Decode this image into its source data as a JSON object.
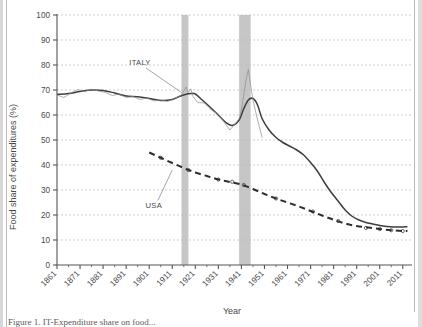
{
  "figure": {
    "caption_partial": "Figure 1. IT-Expenditure share on food...",
    "background_color": "#ffffff"
  },
  "chart_data": {
    "type": "line",
    "title": "",
    "xlabel": "Year",
    "ylabel": "Food share of expenditures (%)",
    "xlim": [
      1861,
      2015
    ],
    "ylim": [
      0,
      100
    ],
    "yticks": [
      0,
      10,
      20,
      30,
      40,
      50,
      60,
      70,
      80,
      90,
      100
    ],
    "xticks": [
      1861,
      1871,
      1881,
      1891,
      1901,
      1911,
      1921,
      1931,
      1941,
      1951,
      1961,
      1971,
      1981,
      1991,
      2001,
      2011
    ],
    "xtick_labels": [
      "1861",
      "1871",
      "1881",
      "1891",
      "1901",
      "1911",
      "1921",
      "1931",
      "1941",
      "1951",
      "1961",
      "1971",
      "1981",
      "1991",
      "2001",
      "2011"
    ],
    "grid": "horizontal-dashed",
    "legend_position": "inline-annotations",
    "colors": {
      "italy_smooth": "#3d3d3d",
      "italy_raw": "#8e8e8e",
      "usa_dashed": "#2e2e2e",
      "war_band": "#c6c6c6",
      "grid": "#b9b9b9",
      "axis": "#555555"
    },
    "annotations": [
      {
        "name": "ITALY",
        "label": "ITALY",
        "x": 1897,
        "y": 80,
        "leader_to_x": 1915,
        "leader_to_y": 69
      },
      {
        "name": "USA",
        "label": "USA",
        "x": 1903,
        "y": 23,
        "leader_to_x": 1911,
        "leader_to_y": 38
      }
    ],
    "shaded_bands": [
      {
        "name": "world-war-one",
        "x0": 1915,
        "x1": 1918,
        "label": "WWI"
      },
      {
        "name": "world-war-two",
        "x0": 1940,
        "x1": 1945,
        "label": "WWII"
      }
    ],
    "series": [
      {
        "name": "ITALY",
        "style": "solid",
        "x": [
          1861,
          1866,
          1871,
          1876,
          1881,
          1886,
          1891,
          1896,
          1901,
          1906,
          1911,
          1914,
          1917,
          1919,
          1921,
          1924,
          1927,
          1931,
          1934,
          1937,
          1940,
          1942,
          1944,
          1946,
          1948,
          1950,
          1953,
          1956,
          1959,
          1962,
          1965,
          1968,
          1971,
          1974,
          1977,
          1980,
          1983,
          1986,
          1989,
          1992,
          1995,
          1998,
          2001,
          2004,
          2007,
          2010,
          2013
        ],
        "values": [
          68.2,
          68.6,
          69.4,
          70.0,
          69.8,
          68.8,
          67.6,
          67.3,
          66.6,
          65.8,
          66.2,
          67.4,
          68.3,
          68.6,
          68.4,
          66.0,
          63.5,
          60.0,
          57.2,
          55.8,
          58.0,
          62.5,
          66.0,
          66.6,
          64.0,
          58.5,
          54.0,
          51.0,
          49.0,
          47.5,
          46.0,
          44.0,
          41.0,
          37.5,
          33.0,
          29.0,
          25.5,
          22.0,
          19.5,
          18.0,
          17.0,
          16.4,
          15.8,
          15.4,
          15.2,
          15.2,
          15.3
        ]
      },
      {
        "name": "ITALY-raw",
        "style": "thin-noisy",
        "x": [
          1861,
          1864,
          1867,
          1870,
          1873,
          1876,
          1879,
          1882,
          1885,
          1888,
          1891,
          1894,
          1897,
          1900,
          1903,
          1906,
          1909,
          1912,
          1915,
          1917,
          1918,
          1919,
          1920,
          1922,
          1925,
          1928,
          1931,
          1934,
          1936,
          1938,
          1940,
          1941,
          1942,
          1943,
          1944,
          1945,
          1946,
          1947,
          1948,
          1950
        ],
        "values": [
          68.0,
          67.0,
          68.8,
          70.2,
          69.4,
          70.3,
          69.6,
          69.0,
          67.8,
          68.4,
          67.0,
          67.4,
          66.2,
          66.8,
          65.6,
          66.0,
          65.4,
          66.6,
          68.0,
          71.2,
          69.0,
          70.5,
          67.4,
          65.0,
          64.8,
          62.0,
          60.4,
          56.5,
          54.0,
          56.2,
          58.4,
          62.0,
          68.0,
          74.0,
          78.2,
          72.0,
          66.0,
          62.0,
          58.0,
          51.0
        ]
      },
      {
        "name": "USA",
        "style": "dashed",
        "x": [
          1901,
          1906,
          1911,
          1916,
          1921,
          1926,
          1931,
          1936,
          1941,
          1946,
          1951,
          1956,
          1961,
          1966,
          1971,
          1976,
          1981,
          1986,
          1991,
          1996,
          2001,
          2006,
          2011,
          2013
        ],
        "values": [
          45.0,
          42.9,
          40.8,
          38.8,
          37.0,
          35.6,
          34.2,
          33.2,
          32.2,
          30.4,
          28.4,
          26.6,
          25.0,
          23.4,
          21.6,
          19.8,
          18.1,
          16.6,
          15.6,
          15.0,
          14.4,
          13.9,
          13.6,
          13.6
        ]
      }
    ],
    "usa_markers": {
      "name": "usa-data-points",
      "x": [
        1906,
        1918,
        1931,
        1937,
        1942,
        1956,
        1972,
        1983,
        1995,
        2001,
        2006,
        2011
      ],
      "values": [
        42.9,
        38.0,
        34.2,
        33.3,
        32.0,
        26.6,
        21.4,
        17.6,
        14.8,
        14.4,
        13.9,
        13.6
      ]
    }
  }
}
